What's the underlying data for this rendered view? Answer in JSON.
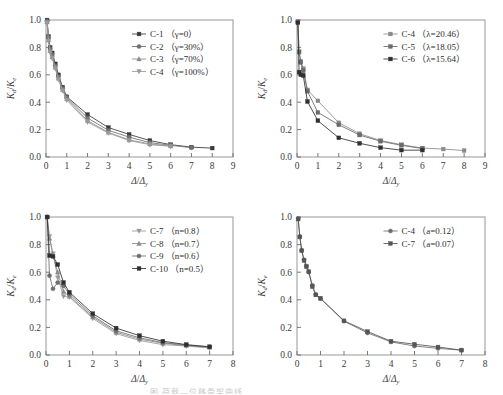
{
  "figure": {
    "background": "#ffffff",
    "axis_color": "#555555",
    "caption_fragment": "图     荷载—位移骨架曲线"
  },
  "chart_data": [
    {
      "type": "line",
      "title": "",
      "xlabel": "Δ/Δy",
      "ylabel": "Kd/Ke",
      "xlim": [
        0,
        9
      ],
      "ylim": [
        0,
        1.0
      ],
      "xticks": [
        0,
        1,
        2,
        3,
        4,
        5,
        6,
        7,
        8,
        9
      ],
      "yticks": [
        "0.0",
        "0.2",
        "0.4",
        "0.6",
        "0.8",
        "1.0"
      ],
      "grid": false,
      "legend_position": "upper-right",
      "series": [
        {
          "name": "C-1 （γ=0）",
          "marker": "square",
          "color": "#3a3a3a",
          "x": [
            0.05,
            0.12,
            0.2,
            0.3,
            0.45,
            0.6,
            0.8,
            1.0,
            2.0,
            3.0,
            4.0,
            5.0,
            6.0,
            7.0,
            8.0
          ],
          "y": [
            1.0,
            0.88,
            0.8,
            0.76,
            0.68,
            0.6,
            0.51,
            0.44,
            0.31,
            0.215,
            0.165,
            0.12,
            0.09,
            0.072,
            0.065
          ]
        },
        {
          "name": "C-2 （γ=30%）",
          "marker": "circle",
          "color": "#6e6e6e",
          "x": [
            0.05,
            0.12,
            0.2,
            0.3,
            0.45,
            0.6,
            0.8,
            1.0,
            2.0,
            3.0,
            4.0,
            5.0,
            6.0,
            7.0
          ],
          "y": [
            0.99,
            0.87,
            0.79,
            0.745,
            0.665,
            0.585,
            0.5,
            0.435,
            0.285,
            0.195,
            0.145,
            0.105,
            0.085,
            0.068
          ]
        },
        {
          "name": "C-3 （γ=70%）",
          "marker": "triangle-up",
          "color": "#8a8a8a",
          "x": [
            0.05,
            0.12,
            0.2,
            0.3,
            0.45,
            0.6,
            0.8,
            1.0,
            2.0,
            3.0,
            4.0,
            5.0,
            6.0
          ],
          "y": [
            0.985,
            0.855,
            0.775,
            0.73,
            0.655,
            0.575,
            0.49,
            0.425,
            0.265,
            0.18,
            0.125,
            0.095,
            0.08
          ]
        },
        {
          "name": "C-4 （γ=100%）",
          "marker": "triangle-down",
          "color": "#9a9a9a",
          "x": [
            0.05,
            0.12,
            0.2,
            0.3,
            0.45,
            0.6,
            0.8,
            1.0,
            2.0,
            3.0,
            4.0,
            5.0,
            6.0
          ],
          "y": [
            0.98,
            0.845,
            0.765,
            0.72,
            0.645,
            0.565,
            0.485,
            0.415,
            0.255,
            0.175,
            0.12,
            0.09,
            0.078
          ]
        }
      ]
    },
    {
      "type": "line",
      "title": "",
      "xlabel": "Δ/Δy",
      "ylabel": "Kd/Ke",
      "xlim": [
        0,
        9
      ],
      "ylim": [
        0,
        1.0
      ],
      "xticks": [
        0,
        1,
        2,
        3,
        4,
        5,
        6,
        7,
        8,
        9
      ],
      "yticks": [
        "0.0",
        "0.2",
        "0.4",
        "0.6",
        "0.8",
        "1.0"
      ],
      "grid": false,
      "legend_position": "upper-right",
      "series": [
        {
          "name": "C-4 （λ=20.46）",
          "marker": "square",
          "color": "#8a8a8a",
          "x": [
            0.04,
            0.1,
            0.18,
            0.3,
            0.5,
            1.0,
            2.0,
            3.0,
            4.0,
            5.0,
            6.0,
            7.0,
            8.0
          ],
          "y": [
            0.99,
            0.77,
            0.7,
            0.645,
            0.49,
            0.41,
            0.25,
            0.17,
            0.12,
            0.09,
            0.065,
            0.058,
            0.047
          ]
        },
        {
          "name": "C-5 （λ=18.05）",
          "marker": "square",
          "color": "#6a6a6a",
          "x": [
            0.04,
            0.1,
            0.18,
            0.3,
            0.5,
            1.0,
            2.0,
            3.0,
            4.0,
            5.0,
            6.0
          ],
          "y": [
            0.985,
            0.765,
            0.69,
            0.63,
            0.48,
            0.325,
            0.235,
            0.16,
            0.115,
            0.085,
            0.062
          ]
        },
        {
          "name": "C-6 （λ=15.64）",
          "marker": "square",
          "color": "#2f2f2f",
          "x": [
            0.04,
            0.1,
            0.18,
            0.3,
            0.5,
            1.0,
            2.0,
            3.0,
            4.0,
            5.0,
            6.0
          ],
          "y": [
            0.98,
            0.62,
            0.6,
            0.595,
            0.405,
            0.265,
            0.14,
            0.1,
            0.068,
            0.05,
            0.05
          ]
        }
      ]
    },
    {
      "type": "line",
      "title": "",
      "xlabel": "Δ/Δy",
      "ylabel": "Kd/Ke",
      "xlim": [
        0,
        8
      ],
      "ylim": [
        0,
        1.0
      ],
      "xticks": [
        0,
        1,
        2,
        3,
        4,
        5,
        6,
        7,
        8
      ],
      "yticks": [
        "0.0",
        "0.2",
        "0.4",
        "0.6",
        "0.8",
        "1.0"
      ],
      "grid": false,
      "legend_position": "upper-right",
      "series": [
        {
          "name": "C-7 （n=0.8）",
          "marker": "triangle-down",
          "color": "#9a9a9a",
          "x": [
            0.05,
            0.15,
            0.3,
            0.5,
            0.75,
            1.0,
            2.0,
            3.0,
            4.0,
            5.0,
            6.0,
            7.0
          ],
          "y": [
            1.0,
            0.86,
            0.735,
            0.56,
            0.425,
            0.42,
            0.265,
            0.155,
            0.105,
            0.075,
            0.065,
            0.05
          ]
        },
        {
          "name": "C-8 （n=0.7）",
          "marker": "triangle-up",
          "color": "#8a8a8a",
          "x": [
            0.05,
            0.15,
            0.3,
            0.5,
            0.75,
            1.0,
            2.0,
            3.0,
            4.0,
            5.0,
            6.0,
            7.0
          ],
          "y": [
            1.0,
            0.845,
            0.72,
            0.6,
            0.46,
            0.425,
            0.275,
            0.165,
            0.115,
            0.085,
            0.068,
            0.055
          ]
        },
        {
          "name": "C-9 （n=0.6）",
          "marker": "circle",
          "color": "#6e6e6e",
          "x": [
            0.05,
            0.15,
            0.3,
            0.5,
            0.75,
            1.0,
            2.0,
            3.0,
            4.0,
            5.0,
            6.0,
            7.0
          ],
          "y": [
            1.0,
            0.575,
            0.48,
            0.525,
            0.5,
            0.44,
            0.285,
            0.175,
            0.125,
            0.09,
            0.072,
            0.058
          ]
        },
        {
          "name": "C-10 （n=0.5）",
          "marker": "square",
          "color": "#2f2f2f",
          "x": [
            0.05,
            0.15,
            0.3,
            0.5,
            0.75,
            1.0,
            2.0,
            3.0,
            4.0,
            5.0,
            6.0,
            7.0
          ],
          "y": [
            1.0,
            0.72,
            0.715,
            0.655,
            0.525,
            0.455,
            0.3,
            0.195,
            0.14,
            0.1,
            0.075,
            0.06
          ]
        }
      ]
    },
    {
      "type": "line",
      "title": "",
      "xlabel": "Δ/Δy",
      "ylabel": "Kd/Ke",
      "xlim": [
        0,
        8
      ],
      "ylim": [
        0,
        1.0
      ],
      "xticks": [
        0,
        1,
        2,
        3,
        4,
        5,
        6,
        7,
        8
      ],
      "yticks": [
        "0.0",
        "0.2",
        "0.4",
        "0.6",
        "0.8",
        "1.0"
      ],
      "grid": false,
      "legend_position": "upper-right",
      "series": [
        {
          "name": "C-4 （a=0.12）",
          "marker": "circle",
          "color": "#6e6e6e",
          "x": [
            0.05,
            0.12,
            0.2,
            0.3,
            0.4,
            0.5,
            0.65,
            0.8,
            1.0,
            2.0,
            3.0,
            4.0,
            5.0,
            6.0,
            7.0
          ],
          "y": [
            0.99,
            0.86,
            0.76,
            0.69,
            0.645,
            0.6,
            0.505,
            0.44,
            0.41,
            0.245,
            0.16,
            0.095,
            0.065,
            0.048,
            0.035
          ]
        },
        {
          "name": "C-7 （a=0.07）",
          "marker": "square",
          "color": "#555555",
          "x": [
            0.05,
            0.12,
            0.2,
            0.3,
            0.4,
            0.5,
            0.65,
            0.8,
            1.0,
            2.0,
            3.0,
            4.0,
            5.0,
            6.0,
            7.0
          ],
          "y": [
            0.985,
            0.855,
            0.755,
            0.685,
            0.64,
            0.605,
            0.495,
            0.435,
            0.41,
            0.248,
            0.17,
            0.1,
            0.078,
            0.058,
            0.035
          ]
        }
      ]
    }
  ]
}
